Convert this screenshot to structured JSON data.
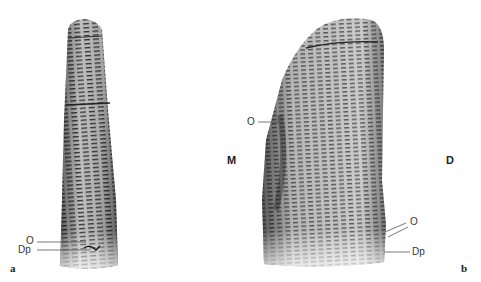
{
  "figure": {
    "panels": [
      {
        "id": "a",
        "letter": "a",
        "labels": {
          "opening": "O",
          "dentin_pulp": "Dp"
        }
      },
      {
        "id": "b",
        "letter": "b",
        "labels": {
          "opening_left": "O",
          "opening_right": "O",
          "dentin_pulp": "Dp",
          "mesial": "M",
          "distal": "D"
        }
      }
    ],
    "colors": {
      "background": "#ffffff",
      "scan_dark": "#2a2a2a",
      "scan_mid": "#7a7a7a",
      "scan_light": "#d8d8d8",
      "leader_line": "#555555"
    }
  }
}
